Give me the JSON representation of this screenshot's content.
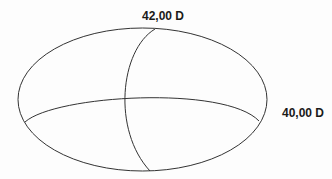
{
  "diagram": {
    "title": "",
    "labels": {
      "vertical_meridian_power": "42,00 D",
      "horizontal_meridian_power": "40,00 D"
    },
    "colors": {
      "stroke": "#333333",
      "text": "#1a1a1a",
      "background": "#fdfdfd"
    }
  }
}
